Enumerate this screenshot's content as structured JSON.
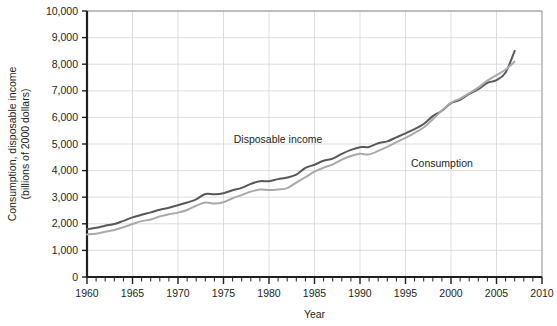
{
  "chart_data": {
    "type": "line",
    "title": "",
    "xlabel": "Year",
    "ylabel": "Consumption, disposable income (billions of 2000 dollars)",
    "ylabel_line1": "Consumption, disposable income",
    "ylabel_line2": "(billions of 2000 dollars)",
    "xlim": [
      1960,
      2010
    ],
    "ylim": [
      0,
      10000
    ],
    "x_tick_labels": [
      "1960",
      "1965",
      "1970",
      "1975",
      "1980",
      "1985",
      "1990",
      "1995",
      "2000",
      "2005",
      "2010"
    ],
    "x_ticks": [
      1960,
      1965,
      1970,
      1975,
      1980,
      1985,
      1990,
      1995,
      2000,
      2005,
      2010
    ],
    "x_minor_tick_step": 1,
    "y_tick_labels": [
      "0",
      "1,000",
      "2,000",
      "3,000",
      "4,000",
      "5,000",
      "6,000",
      "7,000",
      "8,000",
      "9,000",
      "10,000"
    ],
    "y_ticks": [
      0,
      1000,
      2000,
      3000,
      4000,
      5000,
      6000,
      7000,
      8000,
      9000,
      10000
    ],
    "grid": true,
    "legend_position": "inline-annotation",
    "annotations": [
      {
        "text": "Disposable income",
        "x": 1981,
        "y": 5050
      },
      {
        "text": "Consumption",
        "x": 1999,
        "y": 4150
      }
    ],
    "x": [
      1960,
      1961,
      1962,
      1963,
      1964,
      1965,
      1966,
      1967,
      1968,
      1969,
      1970,
      1971,
      1972,
      1973,
      1974,
      1975,
      1976,
      1977,
      1978,
      1979,
      1980,
      1981,
      1982,
      1983,
      1984,
      1985,
      1986,
      1987,
      1988,
      1989,
      1990,
      1991,
      1992,
      1993,
      1994,
      1995,
      1996,
      1997,
      1998,
      1999,
      2000,
      2001,
      2002,
      2003,
      2004,
      2005,
      2006,
      2007
    ],
    "series": [
      {
        "name": "Disposable income",
        "color": "#58585c",
        "values": [
          1800,
          1850,
          1930,
          1990,
          2110,
          2240,
          2340,
          2430,
          2530,
          2600,
          2700,
          2800,
          2920,
          3120,
          3110,
          3150,
          3260,
          3350,
          3500,
          3600,
          3600,
          3680,
          3740,
          3850,
          4100,
          4220,
          4370,
          4450,
          4630,
          4780,
          4880,
          4890,
          5030,
          5100,
          5250,
          5400,
          5560,
          5750,
          6050,
          6250,
          6540,
          6660,
          6880,
          7060,
          7300,
          7400,
          7690,
          8500
        ]
      },
      {
        "name": "Consumption",
        "color": "#a9a9ae",
        "values": [
          1600,
          1630,
          1700,
          1770,
          1870,
          1990,
          2100,
          2160,
          2280,
          2360,
          2420,
          2520,
          2680,
          2800,
          2760,
          2810,
          2960,
          3080,
          3210,
          3290,
          3270,
          3290,
          3340,
          3550,
          3750,
          3960,
          4110,
          4230,
          4410,
          4550,
          4630,
          4610,
          4740,
          4890,
          5070,
          5230,
          5420,
          5620,
          5930,
          6260,
          6550,
          6710,
          6910,
          7120,
          7380,
          7590,
          7800,
          8100
        ]
      }
    ]
  }
}
